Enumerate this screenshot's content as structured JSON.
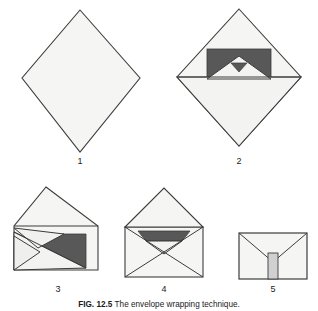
{
  "figure": {
    "caption_label": "FIG. 12.5",
    "caption_text": "The envelope wrapping technique.",
    "background_color": "#ffffff"
  },
  "colors": {
    "paper_fill": "#f5f5f3",
    "paper_fill_shadow": "#ececeb",
    "item_dark_gray": "#585858",
    "item_mid_gray": "#6e6e6e",
    "outline": "#3c3c3c",
    "outline_soft": "#6a6a6a",
    "tape_fill": "#d0d0d0",
    "label_color": "#222222"
  },
  "panels": [
    {
      "id": "panel-1",
      "number": "1",
      "name": "flat-wrap-diamond",
      "description": "Square sheet of wrapping paper laid out as a diamond."
    },
    {
      "id": "panel-2",
      "number": "2",
      "name": "bottom-corner-folded-over-item",
      "description": "Item placed in the centre; bottom corner of the paper folded up over it."
    },
    {
      "id": "panel-3",
      "number": "3",
      "name": "left-side-flap-folded-in",
      "description": "Left corner folded in toward the centre."
    },
    {
      "id": "panel-4",
      "number": "4",
      "name": "both-side-flaps-folded-in",
      "description": "Right corner folded in; both flaps meet forming an envelope."
    },
    {
      "id": "panel-5",
      "number": "5",
      "name": "top-flap-closed-and-taped",
      "description": "Top corner folded down and sealed with a strip of tape."
    }
  ]
}
